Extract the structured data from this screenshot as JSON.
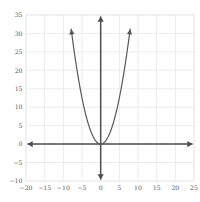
{
  "chart_data": {
    "type": "line",
    "title": "",
    "subtitle": "",
    "xlabel": "",
    "ylabel": "",
    "equation": "y = 0.5x^2",
    "xlim": [
      -20,
      25
    ],
    "ylim": [
      -10,
      35
    ],
    "grid": true,
    "grid_color": "#ececec",
    "axis_color": "#4d4d4f",
    "curve_color": "#58585a",
    "background_color": "#ffffff",
    "legend": "none",
    "xticks": [
      -20,
      -15,
      -10,
      -5,
      0,
      5,
      10,
      15,
      20,
      25
    ],
    "xtick_labels": [
      "-20",
      "-15",
      "-10",
      "-5",
      "0",
      "5",
      "10",
      "15",
      "20",
      "25"
    ],
    "yticks": [
      -10,
      -5,
      0,
      5,
      10,
      15,
      20,
      25,
      30,
      35
    ],
    "ytick_labels": [
      "-10",
      "-5",
      "0",
      "5",
      "10",
      "15",
      "20",
      "25",
      "30",
      "35"
    ],
    "x_axis_arrows": [
      "left",
      "right"
    ],
    "y_axis_arrows": [
      "up",
      "down"
    ],
    "curve_arrows": [
      "left-end",
      "right-end"
    ],
    "series": [
      {
        "name": "y = 0.5x^2",
        "points": [
          [
            -7.9,
            31.2
          ],
          [
            -7.5,
            28.1
          ],
          [
            -7.0,
            24.5
          ],
          [
            -6.5,
            21.1
          ],
          [
            -6.0,
            18.0
          ],
          [
            -5.5,
            15.1
          ],
          [
            -5.0,
            12.5
          ],
          [
            -4.5,
            10.1
          ],
          [
            -4.0,
            8.0
          ],
          [
            -3.5,
            6.1
          ],
          [
            -3.0,
            4.5
          ],
          [
            -2.5,
            3.1
          ],
          [
            -2.0,
            2.0
          ],
          [
            -1.5,
            1.1
          ],
          [
            -1.0,
            0.5
          ],
          [
            -0.5,
            0.1
          ],
          [
            0.0,
            0.0
          ],
          [
            0.5,
            0.1
          ],
          [
            1.0,
            0.5
          ],
          [
            1.5,
            1.1
          ],
          [
            2.0,
            2.0
          ],
          [
            2.5,
            3.1
          ],
          [
            3.0,
            4.5
          ],
          [
            3.5,
            6.1
          ],
          [
            4.0,
            8.0
          ],
          [
            4.5,
            10.1
          ],
          [
            5.0,
            12.5
          ],
          [
            5.5,
            15.1
          ],
          [
            6.0,
            18.0
          ],
          [
            6.5,
            21.1
          ],
          [
            7.0,
            24.5
          ],
          [
            7.5,
            28.1
          ],
          [
            7.9,
            31.2
          ]
        ]
      }
    ],
    "vertex": [
      0,
      0
    ]
  }
}
